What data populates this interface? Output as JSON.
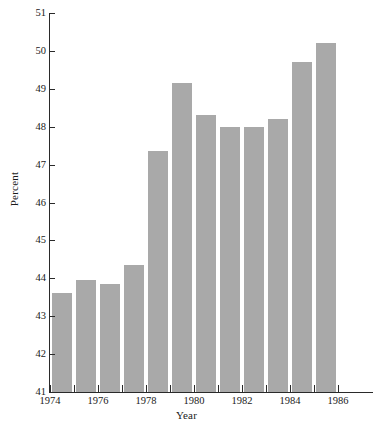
{
  "chart_data": {
    "type": "bar",
    "title": "",
    "xlabel": "Year",
    "ylabel": "Percent",
    "categories": [
      "1975",
      "1976",
      "1977",
      "1978",
      "1979",
      "1980",
      "1981",
      "1982",
      "1983",
      "1984",
      "1985",
      "1986"
    ],
    "values": [
      43.6,
      43.95,
      43.85,
      44.35,
      47.35,
      49.15,
      48.3,
      48.0,
      48.0,
      48.2,
      49.7,
      50.2
    ],
    "xlim": [
      1974,
      1987
    ],
    "ylim": [
      41,
      51
    ],
    "y_ticks": [
      41,
      42,
      43,
      44,
      45,
      46,
      47,
      48,
      49,
      50,
      51
    ],
    "y_tick_labels": [
      "41",
      "42",
      "43",
      "44",
      "45",
      "46",
      "47",
      "48",
      "49",
      "50",
      "51"
    ],
    "x_ticks": [
      1974,
      1975,
      1976,
      1977,
      1978,
      1979,
      1980,
      1981,
      1982,
      1983,
      1984,
      1985,
      1986
    ],
    "x_tick_labels": [
      "1974",
      "",
      "1976",
      "",
      "1978",
      "",
      "1980",
      "",
      "1982",
      "",
      "1984",
      "",
      "1986"
    ],
    "grid": false,
    "legend": null,
    "bar_color": "#a9a9a9",
    "axis_color": "#2a2a2a",
    "background_color": "#ffffff"
  }
}
